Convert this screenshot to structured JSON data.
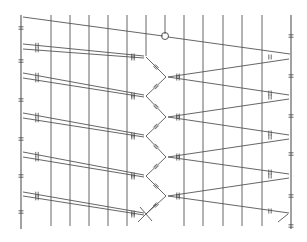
{
  "diagram": {
    "type": "line-drawing",
    "stroke_color": "#555555",
    "tick_color": "#444444",
    "background": "#ffffff",
    "walls": {
      "left_x": 21,
      "right_x": 291,
      "top_y": 15,
      "bottom_y": 229
    },
    "vertical_lines_x": [
      51,
      70,
      89,
      108,
      127,
      146,
      165,
      184,
      203,
      223,
      242,
      262
    ],
    "circle_marker": {
      "x": 165,
      "y": 36,
      "r": 3.5
    },
    "left_wall_points_y": [
      17,
      44,
      49,
      73,
      78,
      113,
      118,
      152,
      157,
      192,
      196
    ],
    "right_wall_points_y": [
      54,
      59,
      95,
      99,
      135,
      139,
      174,
      178,
      213
    ],
    "center_left_vertices": [
      [
        146,
        57
      ],
      [
        146,
        96
      ],
      [
        146,
        136
      ],
      [
        146,
        176
      ],
      [
        146,
        214
      ]
    ],
    "center_right_vertices": [
      [
        166,
        77
      ],
      [
        166,
        117
      ],
      [
        166,
        157
      ],
      [
        166,
        196
      ]
    ]
  }
}
